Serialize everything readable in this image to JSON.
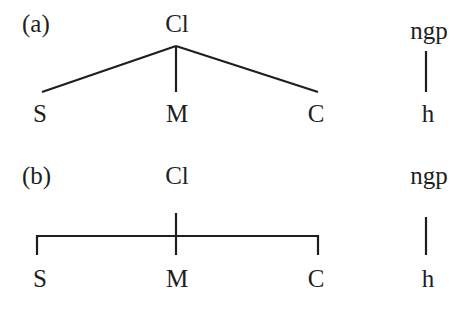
{
  "diagram": {
    "type": "constituency-tree-comparison",
    "panels": [
      {
        "label": "(a)",
        "style": "diagonal-branches",
        "root": "Cl",
        "children": [
          "S",
          "M",
          "C"
        ],
        "side_tree": {
          "root": "ngp",
          "child": "h"
        }
      },
      {
        "label": "(b)",
        "style": "bracket-branches",
        "root": "Cl",
        "children": [
          "S",
          "M",
          "C"
        ],
        "side_tree": {
          "root": "ngp",
          "child": "h"
        }
      }
    ],
    "colors": {
      "background": "#ffffff",
      "ink": "#1e1e1e"
    }
  }
}
